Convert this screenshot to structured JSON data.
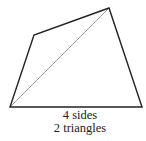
{
  "diagram": {
    "shape": "quadrilateral",
    "vertices": [
      [
        10,
        107
      ],
      [
        34,
        35
      ],
      [
        109,
        8
      ],
      [
        142,
        107
      ]
    ],
    "diagonal": {
      "from": [
        10,
        107
      ],
      "to": [
        109,
        8
      ]
    },
    "edge_color": "#222222",
    "diagonal_color": "#a0a0a0"
  },
  "caption": {
    "line1": "4 sides",
    "line2": "2 triangles"
  }
}
